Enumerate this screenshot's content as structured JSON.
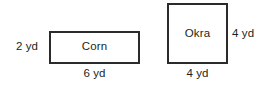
{
  "diagram": {
    "type": "geometry-figure",
    "background_color": "#ffffff",
    "stroke_color": "#2b2b2b",
    "text_color": "#231f20",
    "unit": "yd",
    "shapes": [
      {
        "id": "corn",
        "kind": "rectangle",
        "name": "Corn",
        "width_label": "6 yd",
        "height_label": "2 yd",
        "width_value": 6,
        "height_value": 2
      },
      {
        "id": "okra",
        "kind": "square",
        "name": "Okra",
        "width_label": "4 yd",
        "height_label": "4 yd",
        "width_value": 4,
        "height_value": 4
      }
    ]
  }
}
